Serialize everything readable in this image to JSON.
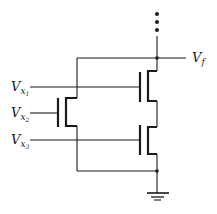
{
  "diagram": {
    "type": "transistor-circuit",
    "labels": {
      "input1": {
        "main": "V",
        "sub": "x",
        "subsub": "1"
      },
      "input2": {
        "main": "V",
        "sub": "x",
        "subsub": "2"
      },
      "input3": {
        "main": "V",
        "sub": "x",
        "subsub": "3"
      },
      "output": {
        "main": "V",
        "sub": "f"
      }
    },
    "components": [
      {
        "id": "transistor-1",
        "gate_input": "V_x1",
        "position": "top-right"
      },
      {
        "id": "transistor-2",
        "gate_input": "V_x2",
        "position": "left"
      },
      {
        "id": "transistor-3",
        "gate_input": "V_x3",
        "position": "bottom-right"
      }
    ],
    "continuation_dots": 3,
    "ground": true,
    "colors": {
      "line": "#1a1a1a",
      "background": "#ffffff"
    }
  }
}
